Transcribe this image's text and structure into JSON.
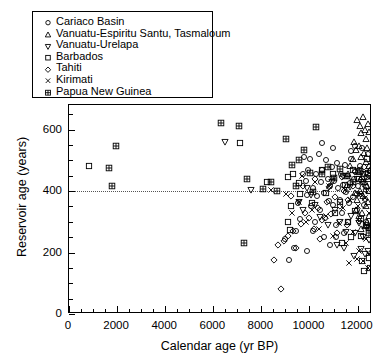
{
  "chart_data": {
    "type": "scatter",
    "title": "",
    "xlabel": "Calendar age (yr BP)",
    "ylabel": "Reservoir age  (years)",
    "xlim": [
      0,
      12600
    ],
    "ylim": [
      0,
      680
    ],
    "xticks": [
      0,
      2000,
      4000,
      6000,
      8000,
      10000,
      12000
    ],
    "xticklabels": [
      "0",
      "2000",
      "4000",
      "6000",
      "8000",
      "10000",
      "12000"
    ],
    "yticks": [
      0,
      200,
      400,
      600
    ],
    "yticklabels": [
      "0",
      "200",
      "400",
      "600"
    ],
    "x_minor_step": 500,
    "y_minor_step": 50,
    "grid": false,
    "legend_position": "upper-left",
    "reference_line": {
      "axis": "y",
      "value": 400,
      "style": "dotted",
      "color": "#555555"
    },
    "series": [
      {
        "name": "Cariaco Basin",
        "marker": "circle",
        "points": [
          [
            9720,
            455
          ],
          [
            9790,
            510
          ],
          [
            9860,
            432
          ],
          [
            9900,
            388
          ],
          [
            9950,
            470
          ],
          [
            10020,
            505
          ],
          [
            10080,
            350
          ],
          [
            10140,
            410
          ],
          [
            10210,
            300
          ],
          [
            10260,
            455
          ],
          [
            10320,
            385
          ],
          [
            10380,
            520
          ],
          [
            10430,
            340
          ],
          [
            10490,
            428
          ],
          [
            10540,
            470
          ],
          [
            10600,
            395
          ],
          [
            10660,
            312
          ],
          [
            10700,
            500
          ],
          [
            10760,
            440
          ],
          [
            10810,
            368
          ],
          [
            10870,
            415
          ],
          [
            10920,
            478
          ],
          [
            10980,
            355
          ],
          [
            11030,
            432
          ],
          [
            11090,
            290
          ],
          [
            11140,
            492
          ],
          [
            11190,
            410
          ],
          [
            11250,
            370
          ],
          [
            11300,
            455
          ],
          [
            11360,
            330
          ],
          [
            11410,
            420
          ],
          [
            11470,
            485
          ],
          [
            11520,
            398
          ],
          [
            11580,
            448
          ],
          [
            11630,
            362
          ],
          [
            11690,
            425
          ],
          [
            11740,
            505
          ],
          [
            11800,
            380
          ],
          [
            11850,
            440
          ],
          [
            11910,
            465
          ],
          [
            11960,
            340
          ],
          [
            12020,
            418
          ],
          [
            12070,
            470
          ],
          [
            12130,
            392
          ],
          [
            12180,
            430
          ],
          [
            12240,
            455
          ],
          [
            12290,
            375
          ],
          [
            12350,
            412
          ],
          [
            12400,
            445
          ],
          [
            12460,
            400
          ],
          [
            12510,
            465
          ],
          [
            9450,
            270
          ],
          [
            9610,
            310
          ],
          [
            9340,
            215
          ],
          [
            9160,
            175
          ],
          [
            8980,
            245
          ],
          [
            9520,
            360
          ],
          [
            10140,
            270
          ],
          [
            10600,
            250
          ],
          [
            11100,
            250
          ],
          [
            11600,
            300
          ],
          [
            10870,
            225
          ],
          [
            9900,
            205
          ],
          [
            12270,
            355
          ],
          [
            12350,
            300
          ],
          [
            11450,
            265
          ],
          [
            12120,
            480
          ],
          [
            11730,
            530
          ],
          [
            10960,
            540
          ],
          [
            10520,
            555
          ],
          [
            11900,
            545
          ],
          [
            12420,
            520
          ],
          [
            12190,
            540
          ]
        ]
      },
      {
        "name": "Vanuatu-Espiritu Santu, Tasmaloum",
        "marker": "triangle-up",
        "points": [
          [
            11980,
            630
          ],
          [
            12090,
            612
          ],
          [
            12160,
            588
          ],
          [
            12220,
            640
          ],
          [
            12300,
            600
          ],
          [
            12370,
            570
          ],
          [
            12430,
            618
          ],
          [
            12490,
            592
          ],
          [
            11860,
            560
          ],
          [
            11920,
            535
          ],
          [
            12040,
            548
          ],
          [
            12130,
            510
          ],
          [
            12250,
            525
          ],
          [
            12340,
            495
          ],
          [
            12410,
            540
          ],
          [
            12470,
            480
          ],
          [
            11790,
            505
          ],
          [
            11700,
            480
          ],
          [
            11620,
            455
          ],
          [
            12060,
            462
          ],
          [
            12180,
            445
          ],
          [
            12290,
            430
          ],
          [
            12380,
            415
          ],
          [
            12450,
            440
          ],
          [
            11550,
            420
          ],
          [
            12520,
            470
          ],
          [
            12230,
            385
          ],
          [
            12120,
            400
          ],
          [
            11990,
            372
          ],
          [
            11880,
            395
          ],
          [
            12340,
            350
          ],
          [
            12440,
            365
          ],
          [
            12200,
            330
          ],
          [
            12080,
            318
          ],
          [
            11950,
            340
          ],
          [
            12380,
            300
          ],
          [
            12290,
            285
          ],
          [
            12160,
            275
          ],
          [
            12460,
            320
          ]
        ]
      },
      {
        "name": "Vanuatu-Urelapa",
        "marker": "triangle-down",
        "points": [
          [
            6500,
            560
          ],
          [
            7550,
            405
          ],
          [
            9580,
            365
          ],
          [
            9740,
            340
          ],
          [
            10420,
            315
          ],
          [
            10760,
            290
          ],
          [
            11050,
            340
          ],
          [
            11280,
            300
          ],
          [
            11520,
            268
          ],
          [
            11720,
            320
          ],
          [
            11900,
            262
          ],
          [
            12080,
            295
          ],
          [
            12240,
            250
          ],
          [
            12380,
            280
          ],
          [
            12470,
            240
          ],
          [
            10080,
            388
          ],
          [
            10250,
            355
          ],
          [
            9880,
            410
          ],
          [
            11150,
            225
          ],
          [
            11420,
            215
          ],
          [
            12160,
            210
          ],
          [
            12300,
            195
          ],
          [
            11840,
            190
          ],
          [
            12420,
            205
          ],
          [
            10950,
            430
          ],
          [
            11380,
            450
          ],
          [
            11680,
            412
          ],
          [
            11980,
            440
          ],
          [
            12210,
            422
          ],
          [
            12350,
            455
          ]
        ]
      },
      {
        "name": "Barbados",
        "marker": "square",
        "points": [
          [
            850,
            480
          ],
          [
            7100,
            555
          ],
          [
            8250,
            430
          ],
          [
            9120,
            445
          ],
          [
            9300,
            455
          ],
          [
            9230,
            350
          ],
          [
            9120,
            300
          ],
          [
            9180,
            272
          ],
          [
            9570,
            425
          ],
          [
            9620,
            390
          ],
          [
            10120,
            362
          ],
          [
            10680,
            395
          ],
          [
            11060,
            330
          ],
          [
            11280,
            365
          ],
          [
            11620,
            300
          ],
          [
            11900,
            335
          ],
          [
            12150,
            310
          ],
          [
            12340,
            290
          ],
          [
            12200,
            172
          ],
          [
            12280,
            140
          ],
          [
            10980,
            455
          ],
          [
            11480,
            420
          ],
          [
            11800,
            470
          ],
          [
            12060,
            438
          ],
          [
            12420,
            460
          ],
          [
            12480,
            182
          ],
          [
            12520,
            150
          ],
          [
            11720,
            250
          ],
          [
            11350,
            232
          ],
          [
            12130,
            255
          ],
          [
            10530,
            470
          ],
          [
            12480,
            400
          ],
          [
            12400,
            505
          ]
        ]
      },
      {
        "name": "Tahiti",
        "marker": "diamond",
        "points": [
          [
            8800,
            80
          ],
          [
            8520,
            175
          ],
          [
            8700,
            225
          ],
          [
            8950,
            238
          ],
          [
            9100,
            255
          ],
          [
            9330,
            270
          ],
          [
            9460,
            215
          ],
          [
            9650,
            292
          ],
          [
            9820,
            330
          ],
          [
            10000,
            312
          ],
          [
            10180,
            275
          ],
          [
            10360,
            345
          ],
          [
            10540,
            305
          ],
          [
            10720,
            365
          ],
          [
            10900,
            325
          ],
          [
            11080,
            380
          ],
          [
            11260,
            350
          ],
          [
            11440,
            400
          ],
          [
            11620,
            372
          ],
          [
            11800,
            418
          ],
          [
            11980,
            390
          ],
          [
            12160,
            435
          ],
          [
            12340,
            405
          ],
          [
            12460,
            450
          ],
          [
            9240,
            385
          ],
          [
            9720,
            415
          ],
          [
            10230,
            440
          ],
          [
            10800,
            412
          ],
          [
            11340,
            445
          ],
          [
            11880,
            462
          ],
          [
            12280,
            478
          ],
          [
            10420,
            245
          ],
          [
            11140,
            265
          ],
          [
            11560,
            288
          ],
          [
            12050,
            302
          ]
        ]
      },
      {
        "name": "Kirimati",
        "marker": "cross",
        "points": [
          [
            8420,
            405
          ],
          [
            9020,
            392
          ],
          [
            9280,
            330
          ],
          [
            9560,
            365
          ],
          [
            9840,
            300
          ],
          [
            10120,
            340
          ],
          [
            10400,
            275
          ],
          [
            10680,
            318
          ],
          [
            10960,
            255
          ],
          [
            11240,
            295
          ],
          [
            11520,
            230
          ],
          [
            11800,
            268
          ],
          [
            12080,
            205
          ],
          [
            12360,
            245
          ],
          [
            12480,
            195
          ],
          [
            11960,
            180
          ],
          [
            11640,
            165
          ],
          [
            12240,
            172
          ],
          [
            12420,
            150
          ],
          [
            11380,
            345
          ],
          [
            11700,
            370
          ],
          [
            12000,
            352
          ],
          [
            12300,
            378
          ],
          [
            12460,
            330
          ],
          [
            10250,
            430
          ],
          [
            10820,
            418
          ],
          [
            11460,
            402
          ],
          [
            12140,
            390
          ],
          [
            9680,
            448
          ]
        ]
      },
      {
        "name": "Papua New Guinea",
        "marker": "square-grid",
        "points": [
          [
            1950,
            545
          ],
          [
            1680,
            475
          ],
          [
            1780,
            418
          ],
          [
            6300,
            620
          ],
          [
            7050,
            612
          ],
          [
            7400,
            438
          ],
          [
            8050,
            408
          ],
          [
            8420,
            430
          ],
          [
            8650,
            400
          ],
          [
            9020,
            568
          ],
          [
            9280,
            485
          ],
          [
            9560,
            500
          ],
          [
            9780,
            532
          ],
          [
            10020,
            460
          ],
          [
            10280,
            610
          ],
          [
            10520,
            455
          ],
          [
            10760,
            478
          ],
          [
            11020,
            442
          ],
          [
            11280,
            472
          ],
          [
            11540,
            450
          ],
          [
            7280,
            232
          ],
          [
            12460,
            280
          ],
          [
            12480,
            262
          ],
          [
            11820,
            430
          ],
          [
            12100,
            465
          ],
          [
            10140,
            398
          ],
          [
            9420,
            415
          ]
        ]
      }
    ]
  }
}
